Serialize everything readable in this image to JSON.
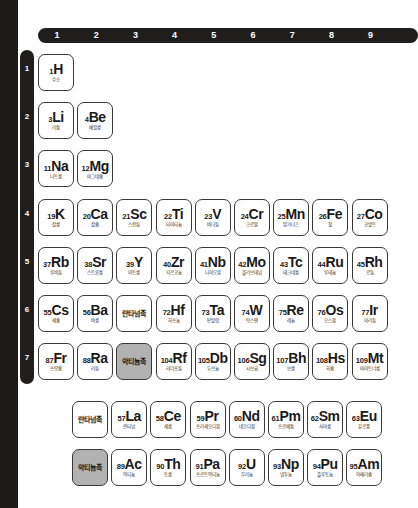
{
  "layout": {
    "background_color": "#ffffff",
    "bar_color": "#1f1e1d",
    "cell_border_color": "#3a3938",
    "highlight_fill_color": "#b2b2b2"
  },
  "column_header": {
    "name": "group-number-bar",
    "numbers": [
      "1",
      "2",
      "3",
      "4",
      "5",
      "6",
      "7",
      "8",
      "9"
    ]
  },
  "row_header": {
    "name": "period-number-bar",
    "numbers": [
      "1",
      "2",
      "3",
      "4",
      "5",
      "6",
      "7"
    ]
  },
  "main_table": {
    "rows": [
      {
        "period": "1",
        "cells": [
          {
            "col": 1,
            "number": "1",
            "symbol": "H",
            "name": "수소",
            "filled": false
          }
        ]
      },
      {
        "period": "2",
        "cells": [
          {
            "col": 1,
            "number": "3",
            "symbol": "Li",
            "name": "리튬",
            "filled": false
          },
          {
            "col": 2,
            "number": "4",
            "symbol": "Be",
            "name": "베릴륨",
            "filled": false
          }
        ]
      },
      {
        "period": "3",
        "cells": [
          {
            "col": 1,
            "number": "11",
            "symbol": "Na",
            "name": "나트륨",
            "filled": false
          },
          {
            "col": 2,
            "number": "12",
            "symbol": "Mg",
            "name": "마그네슘",
            "filled": false
          }
        ]
      },
      {
        "period": "4",
        "cells": [
          {
            "col": 1,
            "number": "19",
            "symbol": "K",
            "name": "칼륨",
            "filled": false
          },
          {
            "col": 2,
            "number": "20",
            "symbol": "Ca",
            "name": "칼슘",
            "filled": false
          },
          {
            "col": 3,
            "number": "21",
            "symbol": "Sc",
            "name": "스칸듐",
            "filled": false
          },
          {
            "col": 4,
            "number": "22",
            "symbol": "Ti",
            "name": "타이타늄",
            "filled": false
          },
          {
            "col": 5,
            "number": "23",
            "symbol": "V",
            "name": "바나듐",
            "filled": false
          },
          {
            "col": 6,
            "number": "24",
            "symbol": "Cr",
            "name": "크로뮴",
            "filled": false
          },
          {
            "col": 7,
            "number": "25",
            "symbol": "Mn",
            "name": "망가니즈",
            "filled": false
          },
          {
            "col": 8,
            "number": "26",
            "symbol": "Fe",
            "name": "철",
            "filled": false
          },
          {
            "col": 9,
            "number": "27",
            "symbol": "Co",
            "name": "코발트",
            "filled": false
          }
        ]
      },
      {
        "period": "5",
        "cells": [
          {
            "col": 1,
            "number": "37",
            "symbol": "Rb",
            "name": "루비듐",
            "filled": false
          },
          {
            "col": 2,
            "number": "38",
            "symbol": "Sr",
            "name": "스트론튬",
            "filled": false
          },
          {
            "col": 3,
            "number": "39",
            "symbol": "Y",
            "name": "이트륨",
            "filled": false
          },
          {
            "col": 4,
            "number": "40",
            "symbol": "Zr",
            "name": "지르코늄",
            "filled": false
          },
          {
            "col": 5,
            "number": "41",
            "symbol": "Nb",
            "name": "나이오븀",
            "filled": false
          },
          {
            "col": 6,
            "number": "42",
            "symbol": "Mo",
            "name": "몰리브데넘",
            "filled": false
          },
          {
            "col": 7,
            "number": "43",
            "symbol": "Tc",
            "name": "테크네튬",
            "filled": false
          },
          {
            "col": 8,
            "number": "44",
            "symbol": "Ru",
            "name": "루테늄",
            "filled": false
          },
          {
            "col": 9,
            "number": "45",
            "symbol": "Rh",
            "name": "로듐",
            "filled": false
          }
        ]
      },
      {
        "period": "6",
        "cells": [
          {
            "col": 1,
            "number": "55",
            "symbol": "Cs",
            "name": "세슘",
            "filled": false
          },
          {
            "col": 2,
            "number": "56",
            "symbol": "Ba",
            "name": "바륨",
            "filled": false
          },
          {
            "col": 3,
            "group_label": "란타넘족",
            "filled": false
          },
          {
            "col": 4,
            "number": "72",
            "symbol": "Hf",
            "name": "하프늄",
            "filled": false
          },
          {
            "col": 5,
            "number": "73",
            "symbol": "Ta",
            "name": "탄탈럼",
            "filled": false
          },
          {
            "col": 6,
            "number": "74",
            "symbol": "W",
            "name": "텅스텐",
            "filled": false
          },
          {
            "col": 7,
            "number": "75",
            "symbol": "Re",
            "name": "레늄",
            "filled": false
          },
          {
            "col": 8,
            "number": "76",
            "symbol": "Os",
            "name": "오스뮴",
            "filled": false
          },
          {
            "col": 9,
            "number": "77",
            "symbol": "Ir",
            "name": "이리듐",
            "filled": false
          }
        ]
      },
      {
        "period": "7",
        "cells": [
          {
            "col": 1,
            "number": "87",
            "symbol": "Fr",
            "name": "프랑슘",
            "filled": false
          },
          {
            "col": 2,
            "number": "88",
            "symbol": "Ra",
            "name": "라듐",
            "filled": false
          },
          {
            "col": 3,
            "group_label": "악티늄족",
            "filled": true
          },
          {
            "col": 4,
            "number": "104",
            "symbol": "Rf",
            "name": "러더포듐",
            "filled": false
          },
          {
            "col": 5,
            "number": "105",
            "symbol": "Db",
            "name": "두브늄",
            "filled": false
          },
          {
            "col": 6,
            "number": "106",
            "symbol": "Sg",
            "name": "시보귬",
            "filled": false
          },
          {
            "col": 7,
            "number": "107",
            "symbol": "Bh",
            "name": "보륨",
            "filled": false
          },
          {
            "col": 8,
            "number": "108",
            "symbol": "Hs",
            "name": "하슘",
            "filled": false
          },
          {
            "col": 9,
            "number": "109",
            "symbol": "Mt",
            "name": "마이트너륨",
            "filled": false
          }
        ]
      }
    ]
  },
  "inner_transition_block": {
    "rows": [
      {
        "series": "lanthanide",
        "cells": [
          {
            "col": 0,
            "group_label": "란타넘족",
            "filled": false
          },
          {
            "col": 1,
            "number": "57",
            "symbol": "La",
            "name": "란타넘",
            "filled": false
          },
          {
            "col": 2,
            "number": "58",
            "symbol": "Ce",
            "name": "세륨",
            "filled": false
          },
          {
            "col": 3,
            "number": "59",
            "symbol": "Pr",
            "name": "프라세오디뮴",
            "filled": false
          },
          {
            "col": 4,
            "number": "60",
            "symbol": "Nd",
            "name": "네오디뮴",
            "filled": false
          },
          {
            "col": 5,
            "number": "61",
            "symbol": "Pm",
            "name": "프로메튬",
            "filled": false
          },
          {
            "col": 6,
            "number": "62",
            "symbol": "Sm",
            "name": "사마륨",
            "filled": false
          },
          {
            "col": 7,
            "number": "63",
            "symbol": "Eu",
            "name": "유로퓸",
            "filled": false
          }
        ]
      },
      {
        "series": "actinide",
        "cells": [
          {
            "col": 0,
            "group_label": "악티늄족",
            "filled": true
          },
          {
            "col": 1,
            "number": "89",
            "symbol": "Ac",
            "name": "악티늄",
            "filled": false
          },
          {
            "col": 2,
            "number": "90",
            "symbol": "Th",
            "name": "토륨",
            "filled": false
          },
          {
            "col": 3,
            "number": "91",
            "symbol": "Pa",
            "name": "프로트악티늄",
            "filled": false
          },
          {
            "col": 4,
            "number": "92",
            "symbol": "U",
            "name": "우라늄",
            "filled": false
          },
          {
            "col": 5,
            "number": "93",
            "symbol": "Np",
            "name": "넵투늄",
            "filled": false
          },
          {
            "col": 6,
            "number": "94",
            "symbol": "Pu",
            "name": "플루토늄",
            "filled": false
          },
          {
            "col": 7,
            "number": "95",
            "symbol": "Am",
            "name": "아메리슘",
            "filled": false
          }
        ]
      }
    ]
  }
}
